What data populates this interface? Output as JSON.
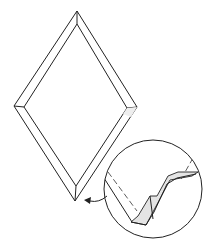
{
  "diagram": {
    "type": "folding-instruction",
    "colors": {
      "line": "#222222",
      "fill_shaded": "#e4e4e4",
      "background": "#ffffff"
    },
    "elements": [
      {
        "id": "outer-diamond",
        "shape": "rhombus",
        "points": [
          [
            77,
            11
          ],
          [
            137,
            107
          ],
          [
            75,
            201
          ],
          [
            14,
            106
          ]
        ]
      },
      {
        "id": "inner-diamond",
        "shape": "rhombus",
        "points": [
          [
            77,
            24
          ],
          [
            127,
            108
          ],
          [
            76,
            186
          ],
          [
            24,
            107
          ]
        ]
      },
      {
        "id": "detail-circle",
        "shape": "circle",
        "center": [
          153,
          189
        ],
        "radius": 49
      },
      {
        "id": "detail-arrow",
        "shape": "curved-arrow",
        "from": [
          107,
          196
        ],
        "to": [
          86,
          201
        ]
      }
    ],
    "caption": ""
  }
}
